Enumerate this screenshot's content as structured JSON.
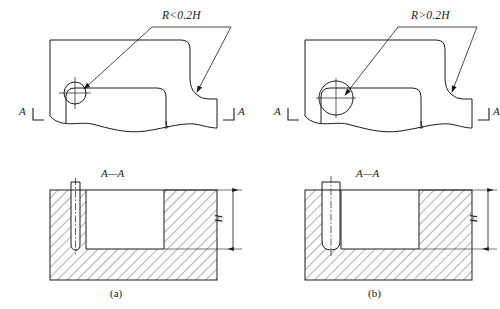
{
  "figure": {
    "line_color": "#1a1a1a",
    "hatch_color": "#1a1a1a",
    "background": "#ffffff"
  },
  "panels": [
    {
      "id": "a",
      "caption": "(a)",
      "note_label": "R<0.2H",
      "section_title": "A—A",
      "section_mark_left": "A",
      "section_mark_right": "A",
      "dimension_label": "H",
      "detail_circle_radius_px": 11,
      "slot_width_px": 9,
      "condition": "R less than 0.2H",
      "detail_note": "small fillet radius at rib root"
    },
    {
      "id": "b",
      "caption": "(b)",
      "note_label": "R>0.2H",
      "section_title": "A—A",
      "section_mark_left": "A",
      "section_mark_right": "A",
      "dimension_label": "H",
      "detail_circle_radius_px": 17,
      "slot_width_px": 18,
      "condition": "R greater than 0.2H",
      "detail_note": "large fillet radius at rib root"
    }
  ]
}
